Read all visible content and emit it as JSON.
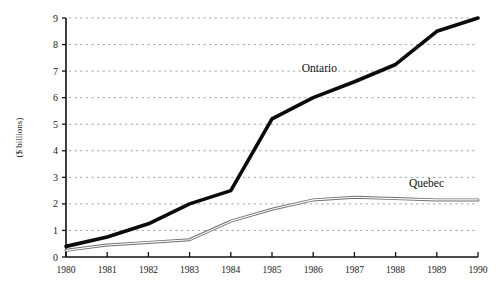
{
  "chart_data": {
    "type": "line",
    "title": "",
    "subtitle": "",
    "xlabel": "",
    "ylabel": "($ billions)",
    "x": [
      1980,
      1981,
      1982,
      1983,
      1984,
      1985,
      1986,
      1987,
      1988,
      1989,
      1990
    ],
    "categories": [
      "1980",
      "1981",
      "1982",
      "1983",
      "1984",
      "1985",
      "1986",
      "1987",
      "1988",
      "1989",
      "1990"
    ],
    "xlim": [
      1980,
      1990
    ],
    "ylim": [
      0,
      9
    ],
    "ytick_values": [
      0,
      1,
      2,
      3,
      4,
      5,
      6,
      7,
      8,
      9
    ],
    "ytick_labels": [
      "0",
      "1",
      "2",
      "3",
      "4",
      "5",
      "6",
      "7",
      "8",
      "9"
    ],
    "grid": "horizontal-dotted",
    "legend_position": "inline-annotations",
    "series": [
      {
        "name": "Ontario",
        "style": "thick-solid-black",
        "color": "#0b0b0b",
        "values": [
          0.4,
          0.75,
          1.25,
          2.0,
          2.5,
          5.2,
          6.0,
          6.6,
          7.25,
          8.5,
          9.0
        ]
      },
      {
        "name": "Quebec",
        "style": "thin-double-outline",
        "color": "#6e6e6e",
        "values": [
          0.25,
          0.45,
          0.55,
          0.65,
          1.35,
          1.8,
          2.15,
          2.25,
          2.2,
          2.15,
          2.15
        ]
      }
    ],
    "annotations": [
      {
        "text": "Ontario",
        "x": 1986.15,
        "y": 6.95
      },
      {
        "text": "Quebec",
        "x": 1988.75,
        "y": 2.62
      }
    ]
  }
}
